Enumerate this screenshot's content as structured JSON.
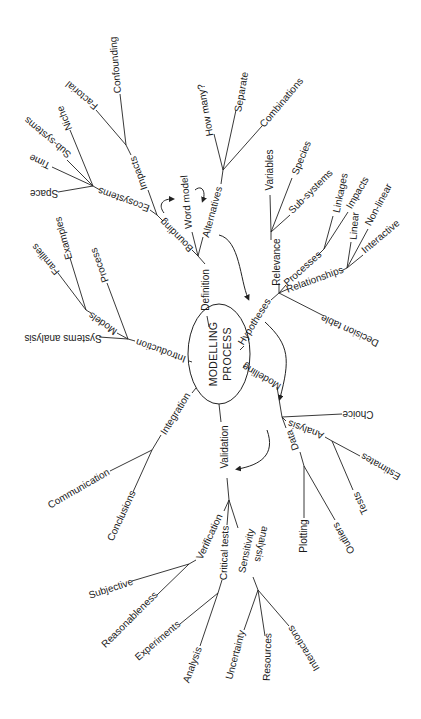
{
  "diagram": {
    "type": "mind-map",
    "center": {
      "line1": "MODELLING",
      "line2": "PROCESS"
    },
    "branches": {
      "definition": "Definition",
      "bounding": "Bounding",
      "ecosystems": "Ecosystems",
      "impacts": "Impacts",
      "confounding": "Confounding",
      "factorial": "Factorial",
      "niche": "Niche",
      "sub_systems_eco": "Sub-systems",
      "time": "Time",
      "space": "Space",
      "word_model": "Word model",
      "alternatives": "Alternatives",
      "how_many": "How many?",
      "separate": "Separate",
      "combinations": "Combinations",
      "hypotheses": "Hypotheses",
      "relevance": "Relevance",
      "variables": "Variables",
      "species": "Species",
      "sub_systems_rel": "Sub-systems",
      "processes": "Processes",
      "linkages": "Linkages",
      "impacts_proc": "Impacts",
      "relationships": "Relationships",
      "linear": "Linear",
      "non_linear": "Non-linear",
      "interactive": "Interactive",
      "decision_table": "Decision table",
      "modelling": "Modelling",
      "choice": "Choice",
      "analysis_mod": "Analysis",
      "estimates": "Estimates",
      "tests": "Tests",
      "data": "Data",
      "plotting": "Plotting",
      "outliers": "Outliers",
      "validation": "Validation",
      "verification": "Verification",
      "subjective": "Subjective",
      "reasonableness": "Reasonableness",
      "critical_tests": "Critical tests",
      "experiments": "Experiments",
      "analysis_crit": "Analysis",
      "sensitivity": "Sensitivity",
      "analysis_sens": "analysis",
      "uncertainty": "Uncertainty",
      "resources": "Resources",
      "interactions": "Interactions",
      "integration": "Integration",
      "communication": "Communication",
      "conclusions": "Conclusions",
      "introduction": "Introduction",
      "systems_analysis": "Systems analysis",
      "models": "Models",
      "process": "Process",
      "families": "Families",
      "examples": "Examples"
    }
  }
}
